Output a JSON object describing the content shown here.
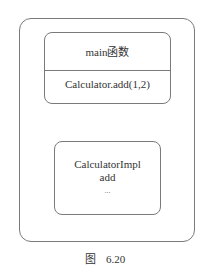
{
  "diagram": {
    "main_box": {
      "title": "main函数",
      "call": "Calculator.add(1,2)"
    },
    "impl_box": {
      "lines": [
        "CalculatorImpl",
        "add",
        "..."
      ]
    },
    "caption": {
      "label": "图",
      "number": "6.20"
    }
  },
  "colors": {
    "border": "#7a7a7a",
    "text": "#333333",
    "background": "#ffffff"
  }
}
